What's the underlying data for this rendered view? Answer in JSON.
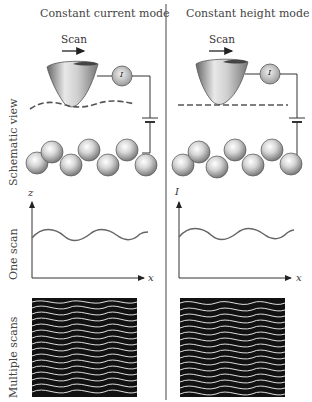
{
  "columns": [
    {
      "title": "Constant current mode",
      "scan_label": "Scan",
      "meter_label": "I",
      "y_axis_label": "z",
      "x_axis_label": "x",
      "surface_line": "wavy-dashed"
    },
    {
      "title": "Constant height mode",
      "scan_label": "Scan",
      "meter_label": "I",
      "y_axis_label": "I",
      "x_axis_label": "x",
      "surface_line": "straight-dashed"
    }
  ],
  "rows": {
    "schematic": "Schematic view",
    "one_scan": "One scan",
    "multiple": "Multiple scans"
  },
  "colors": {
    "line": "#333333",
    "trace": "#555555",
    "scan_bg": "#111111",
    "scan_lines": "#f4f4f4"
  }
}
